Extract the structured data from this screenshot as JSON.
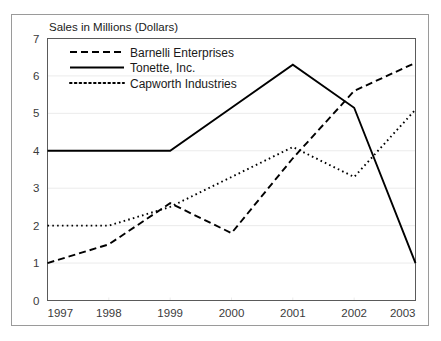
{
  "chart_data": {
    "type": "line",
    "title": "Sales in Millions (Dollars)",
    "xlabel": "",
    "ylabel": "Sales in Millions (Dollars)",
    "x": [
      1997,
      1998,
      1999,
      2000,
      2001,
      2002,
      2003
    ],
    "categories": [
      "1997",
      "1998",
      "1999",
      "2000",
      "2001",
      "2002",
      "2003"
    ],
    "xlim": [
      1997,
      2003
    ],
    "ylim": [
      0,
      7
    ],
    "yticks": [
      0,
      1,
      2,
      3,
      4,
      5,
      6,
      7
    ],
    "ytick_labels": [
      "0",
      "1",
      "2",
      "3",
      "4",
      "5",
      "6",
      "7"
    ],
    "xticks": [
      1997,
      1998,
      1999,
      2000,
      2001,
      2002,
      2003
    ],
    "xtick_labels": [
      "1997",
      "1998",
      "1999",
      "2000",
      "2001",
      "2002",
      "2003"
    ],
    "grid": true,
    "grid_axis": "y",
    "legend_position": "top-left-inside",
    "line_color": "#000000",
    "grid_color": "#ebebeb",
    "frame_color": "#9a9a9a",
    "series": [
      {
        "name": "Barnelli Enterprises",
        "style": "dashed",
        "dash_pattern": "7,4",
        "values": [
          1.0,
          1.5,
          2.6,
          1.8,
          3.8,
          5.6,
          6.35
        ]
      },
      {
        "name": "Tonette, Inc.",
        "style": "solid",
        "dash_pattern": "",
        "values": [
          4.0,
          4.0,
          4.0,
          5.15,
          6.3,
          5.15,
          1.0
        ]
      },
      {
        "name": "Capworth Industries",
        "style": "dotted",
        "dash_pattern": "1.6,3.2",
        "values": [
          2.0,
          2.0,
          2.5,
          3.3,
          4.1,
          3.3,
          5.1
        ]
      }
    ]
  },
  "legend": {
    "items": [
      {
        "label": "Barnelli Enterprises",
        "style": "dashed"
      },
      {
        "label": "Tonette, Inc.",
        "style": "solid"
      },
      {
        "label": "Capworth Industries",
        "style": "dotted"
      }
    ]
  },
  "axis": {
    "title": "Sales in Millions (Dollars)"
  }
}
